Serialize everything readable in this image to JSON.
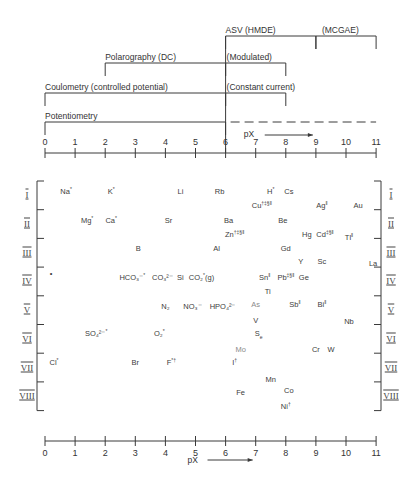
{
  "methods": [
    {
      "name": "ASV (HMDE)",
      "from": 6,
      "to": 9,
      "label": "ASV (HMDE)"
    },
    {
      "name": "MCGAE",
      "from": 9,
      "to": 11,
      "label": "(MCGAE)"
    },
    {
      "name": "Polarography (DC)",
      "from": 2,
      "to": 6,
      "label": "Polarography (DC)"
    },
    {
      "name": "Polarography (Modulated)",
      "from": 6,
      "to": 8,
      "label": "(Modulated)"
    },
    {
      "name": "Coulometry (controlled potential)",
      "from": 0,
      "to": 6,
      "label": "Coulometry (controlled potential)"
    },
    {
      "name": "Coulometry (Constant current)",
      "from": 6,
      "to": 8,
      "label": "(Constant current)"
    },
    {
      "name": "Potentiometry",
      "from": 0,
      "to": 6,
      "label": "Potentiometry",
      "dashed_extension_to": 11
    }
  ],
  "axis": {
    "label": "pX",
    "ticks": [
      "0",
      "1",
      "2",
      "3",
      "4",
      "5",
      "6",
      "7",
      "8",
      "9",
      "10",
      "11"
    ],
    "range": [
      0,
      11
    ]
  },
  "groups": [
    "I",
    "II",
    "III",
    "IV",
    "V",
    "VI",
    "VII",
    "VIII"
  ],
  "species": [
    {
      "text": "Na",
      "sup": "*",
      "px": 0.7,
      "row": 0.0
    },
    {
      "text": "K",
      "sup": "*",
      "px": 2.2,
      "row": 0.0
    },
    {
      "text": "Li",
      "px": 4.5,
      "row": 0.0
    },
    {
      "text": "Rb",
      "px": 5.8,
      "row": 0.0
    },
    {
      "text": "H",
      "sup": "*",
      "px": 7.5,
      "row": 0.0
    },
    {
      "text": "Cs",
      "px": 8.1,
      "row": 0.0
    },
    {
      "text": "Cu",
      "sup": "†‡§‖",
      "px": 7.2,
      "row": 0.5
    },
    {
      "text": "Ag",
      "sup": "‖",
      "px": 9.2,
      "row": 0.5
    },
    {
      "text": "Au",
      "px": 10.4,
      "row": 0.5
    },
    {
      "text": "Mg",
      "sup": "*",
      "px": 1.4,
      "row": 1.0
    },
    {
      "text": "Ca",
      "sup": "*",
      "px": 2.2,
      "row": 1.0
    },
    {
      "text": "Sr",
      "px": 4.1,
      "row": 1.0
    },
    {
      "text": "Ba",
      "px": 6.1,
      "row": 1.0
    },
    {
      "text": "Be",
      "px": 7.9,
      "row": 1.0
    },
    {
      "text": "Zn",
      "sup": "†‡§‖",
      "px": 6.3,
      "row": 1.5
    },
    {
      "text": "Hg",
      "px": 8.7,
      "row": 1.5
    },
    {
      "text": "Cd",
      "sup": "‡§‖",
      "px": 9.3,
      "row": 1.5
    },
    {
      "text": "Tl",
      "sup": "‖",
      "px": 10.1,
      "row": 1.6
    },
    {
      "text": "B",
      "px": 3.1,
      "row": 2.0
    },
    {
      "text": "Al",
      "px": 5.7,
      "row": 2.0
    },
    {
      "text": "Gd",
      "px": 8.0,
      "row": 2.0
    },
    {
      "text": "Y",
      "px": 8.5,
      "row": 2.45
    },
    {
      "text": "Sc",
      "px": 9.2,
      "row": 2.45
    },
    {
      "text": "La",
      "px": 10.9,
      "row": 2.5
    },
    {
      "text": "•",
      "px": 0.2,
      "row": 2.85
    },
    {
      "text": "HCO₃⁻",
      "sup": "*",
      "px": 2.9,
      "row": 3.0
    },
    {
      "text": "CO₃²⁻",
      "px": 3.9,
      "row": 3.0
    },
    {
      "text": "Si",
      "px": 4.5,
      "row": 3.0
    },
    {
      "text": "CO₂",
      "sup": "*",
      "tail": "(g)",
      "px": 5.2,
      "row": 3.0
    },
    {
      "text": "Sn",
      "sup": "‖",
      "px": 7.3,
      "row": 3.0
    },
    {
      "text": "Pb",
      "sup": "‡§‖",
      "px": 8.0,
      "row": 3.0
    },
    {
      "text": "Ge",
      "px": 8.6,
      "row": 3.0
    },
    {
      "text": "Ti",
      "px": 7.4,
      "row": 3.5
    },
    {
      "text": "N₂",
      "px": 4.0,
      "row": 4.0
    },
    {
      "text": "NO₃⁻",
      "px": 4.9,
      "row": 4.0
    },
    {
      "text": "HPO₄²⁻",
      "px": 5.9,
      "row": 4.0
    },
    {
      "text": "As",
      "px": 7.0,
      "row": 3.95,
      "light": true
    },
    {
      "text": "Sb",
      "sup": "‖",
      "px": 8.3,
      "row": 3.95
    },
    {
      "text": "Bi",
      "sup": "‖",
      "px": 9.2,
      "row": 3.95
    },
    {
      "text": "V",
      "px": 7.0,
      "row": 4.5
    },
    {
      "text": "Nb",
      "px": 10.1,
      "row": 4.55
    },
    {
      "text": "S",
      "sub": "e",
      "px": 7.1,
      "row": 4.95
    },
    {
      "text": "SO₄²⁻",
      "sup": "*",
      "px": 1.7,
      "row": 4.95
    },
    {
      "text": "O₂",
      "sup": "*",
      "px": 3.8,
      "row": 4.95
    },
    {
      "text": "Mo",
      "px": 6.5,
      "row": 5.5,
      "light": true
    },
    {
      "text": "Cr",
      "px": 9.0,
      "row": 5.5
    },
    {
      "text": "W",
      "px": 9.5,
      "row": 5.5
    },
    {
      "text": "I",
      "sup": "†",
      "px": 6.3,
      "row": 5.95
    },
    {
      "text": "Cl",
      "sup": "*",
      "px": 0.3,
      "row": 5.95
    },
    {
      "text": "Br",
      "px": 3.0,
      "row": 5.95
    },
    {
      "text": "F",
      "sup": "*†",
      "px": 4.2,
      "row": 5.95
    },
    {
      "text": "Mn",
      "px": 7.5,
      "row": 6.55
    },
    {
      "text": "Fe",
      "px": 6.5,
      "row": 7.0
    },
    {
      "text": "Co",
      "px": 8.1,
      "row": 6.95
    },
    {
      "text": "Ni",
      "sup": "†",
      "px": 8.0,
      "row": 7.5
    }
  ],
  "colors": {
    "ink": "#3a3a3a",
    "light_ink": "#8a8a8a",
    "background": "#ffffff"
  }
}
